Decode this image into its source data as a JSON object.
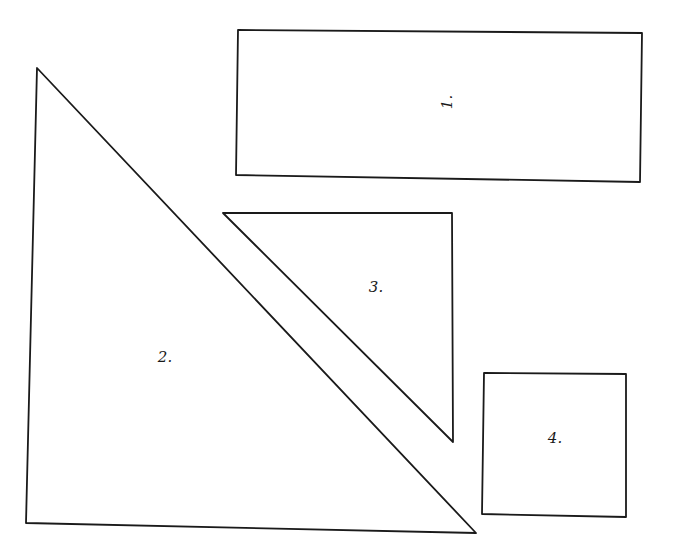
{
  "diagram": {
    "background": "#ffffff",
    "stroke_color": "#1a1a1a",
    "shapes": [
      {
        "id": 1,
        "type": "rectangle",
        "label": "1.",
        "label_rotation": -90,
        "points": [
          [
            238,
            30
          ],
          [
            642,
            33
          ],
          [
            640,
            182
          ],
          [
            236,
            175
          ]
        ],
        "label_pos": [
          452,
          102
        ]
      },
      {
        "id": 2,
        "type": "right-triangle",
        "label": "2.",
        "label_rotation": 0,
        "points": [
          [
            37,
            68
          ],
          [
            476,
            533
          ],
          [
            26,
            523
          ]
        ],
        "label_pos": [
          157,
          362
        ]
      },
      {
        "id": 3,
        "type": "right-triangle",
        "label": "3.",
        "label_rotation": 0,
        "points": [
          [
            223,
            213
          ],
          [
            452,
            213
          ],
          [
            453,
            442
          ]
        ],
        "label_pos": [
          370,
          292
        ]
      },
      {
        "id": 4,
        "type": "square",
        "label": "4.",
        "label_rotation": 0,
        "points": [
          [
            484,
            373
          ],
          [
            626,
            374
          ],
          [
            626,
            517
          ],
          [
            482,
            514
          ]
        ],
        "label_pos": [
          548,
          443
        ]
      }
    ]
  }
}
